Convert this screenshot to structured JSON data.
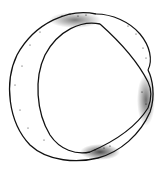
{
  "figure": {
    "style": "stippled line illustration",
    "colors": {
      "background": "#ffffff",
      "ink": "#111111"
    }
  }
}
